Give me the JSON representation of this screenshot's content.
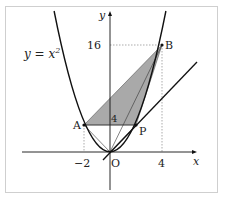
{
  "diagram": {
    "type": "coordinate-geometry",
    "curve_label": "y = x²",
    "curve_label_base": "y = x",
    "curve_label_exp": "2",
    "axes": {
      "x_label": "x",
      "y_label": "y",
      "origin_label": "O"
    },
    "ticks": {
      "x_neg": "−2",
      "x_pos": "4",
      "y_high": "16",
      "y_low": "4"
    },
    "points": [
      {
        "name": "A",
        "label": "A",
        "coords": [
          -2,
          4
        ]
      },
      {
        "name": "B",
        "label": "B",
        "coords": [
          4,
          16
        ]
      },
      {
        "name": "P",
        "label": "P",
        "coords": [
          2,
          4
        ]
      },
      {
        "name": "O",
        "label": "O",
        "coords": [
          0,
          0
        ]
      }
    ],
    "shaded_region": "triangle ABP",
    "colors": {
      "shade": "#a9a9a9",
      "stroke": "#111111",
      "guide": "#888888",
      "frame": "#cfcfcf"
    }
  }
}
